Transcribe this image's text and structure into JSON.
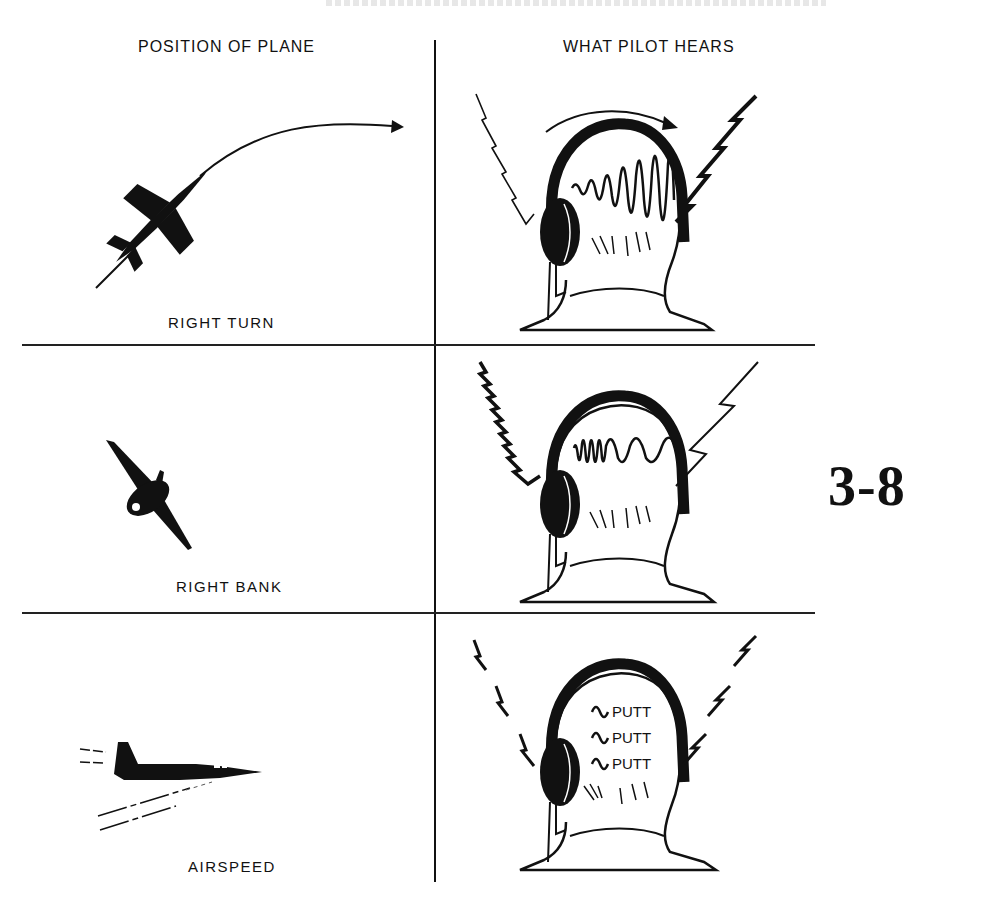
{
  "figure": {
    "number": "3-8",
    "columns": {
      "left_header": "POSITION OF PLANE",
      "right_header": "WHAT PILOT HEARS"
    },
    "rows": [
      {
        "caption": "RIGHT TURN",
        "plane_icon": "jet-climbing-right-turn-icon",
        "sound_icon": "tone-sweeping-left-to-right-icon",
        "sound_description": "wave increasing in amplitude left to right with arrow over head"
      },
      {
        "caption": "RIGHT BANK",
        "plane_icon": "jet-banked-right-icon",
        "sound_icon": "tone-dense-then-sparse-wave-icon",
        "sound_description": "dense wave on left, wider wave on right"
      },
      {
        "caption": "AIRSPEED",
        "plane_icon": "jet-level-flight-icon",
        "sound_icon": "putt-putt-pulse-icon",
        "sound_text": [
          "PUTT",
          "PUTT",
          "PUTT"
        ]
      }
    ]
  },
  "colors": {
    "ink": "#111111",
    "paper": "#ffffff"
  }
}
